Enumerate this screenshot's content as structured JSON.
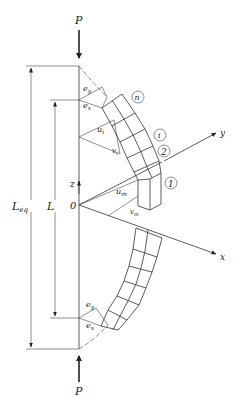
{
  "figure": {
    "type": "engineering diagram"
  },
  "loads": {
    "top": "P",
    "bottom": "P"
  },
  "dimensions": {
    "equivalent_length": "L",
    "equivalent_length_sub": "eq",
    "length": "L"
  },
  "axes": {
    "origin": "0",
    "z": "z",
    "y": "y",
    "x": "x"
  },
  "displacements": {
    "u_i": {
      "base": "u",
      "sub": "i"
    },
    "v_i": {
      "base": "v",
      "sub": "i"
    },
    "u_m": {
      "base": "u",
      "sub": "m"
    },
    "v_m": {
      "base": "v",
      "sub": "m"
    }
  },
  "eccentricities": {
    "top_ey": {
      "base": "e",
      "sub": "y"
    },
    "top_ex": {
      "base": "e",
      "sub": "x"
    },
    "bottom_ey": {
      "base": "e",
      "sub": "y"
    },
    "bottom_ex": {
      "base": "e",
      "sub": "x"
    }
  },
  "segment_labels": [
    "n",
    "i",
    "2",
    "1"
  ]
}
